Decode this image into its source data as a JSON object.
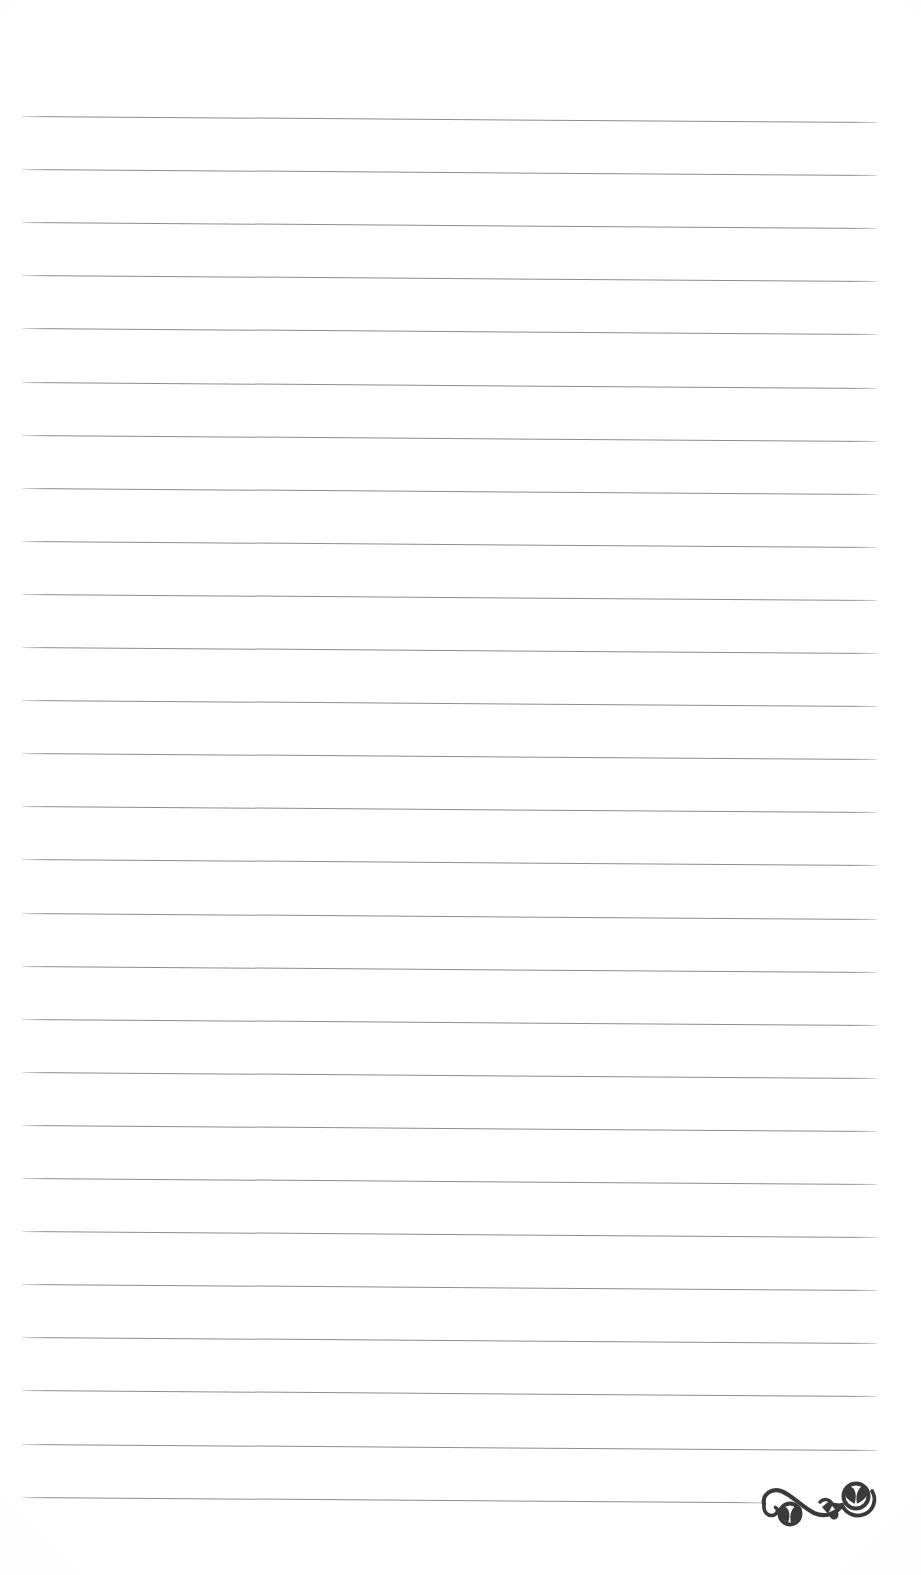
{
  "page": {
    "kind": "lined-notebook-page",
    "width": 921,
    "height": 1575,
    "background_color": "#ffffff",
    "text_content": ""
  },
  "ruling": {
    "line_count": 27,
    "line_color": "#8d8d90",
    "line_thickness_px": 1,
    "first_line_y": 116,
    "line_spacing_px": 53.1,
    "left_margin_x": 22,
    "right_margin_x": 877,
    "skew_degrees": 0.4,
    "line_lengths_px": [
      855,
      855,
      855,
      855,
      855,
      855,
      855,
      855,
      855,
      855,
      855,
      855,
      855,
      855,
      855,
      855,
      855,
      855,
      855,
      855,
      855,
      855,
      855,
      855,
      855,
      855,
      740
    ]
  },
  "ornament": {
    "name": "decorative-flourish",
    "description": "Double-scroll calligraphic flourish with heart-shaped leaf fills",
    "color": "#3a3a3c",
    "position_x": 758,
    "position_y": 1474,
    "width": 130,
    "height": 58
  }
}
